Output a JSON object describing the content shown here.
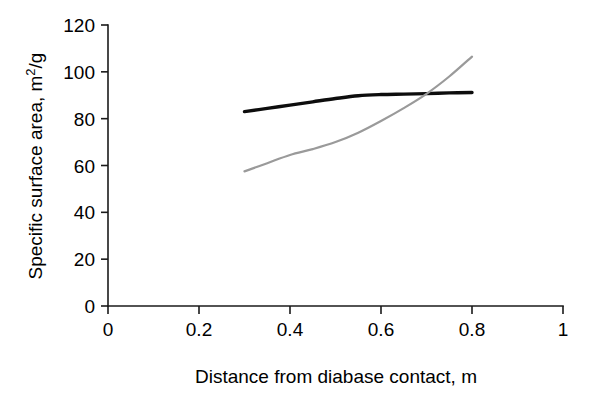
{
  "chart_data": {
    "type": "line",
    "title": "",
    "xlabel": "Distance from diabase contact, m",
    "ylabel": "Specific surface area, m2/g",
    "ylabel_parts": {
      "prefix": "Specific surface area, m",
      "superscript": "2",
      "suffix": "/g"
    },
    "xlim": [
      0,
      1
    ],
    "ylim": [
      0,
      120
    ],
    "xticks": [
      0,
      0.2,
      0.4,
      0.6,
      0.8,
      1
    ],
    "xticklabels": [
      "0",
      "0.2",
      "0.4",
      "0.6",
      "0.8",
      "1"
    ],
    "yticks": [
      0,
      20,
      40,
      60,
      80,
      100,
      120
    ],
    "yticklabels": [
      "0",
      "20",
      "40",
      "60",
      "80",
      "100",
      "120"
    ],
    "grid": false,
    "legend": "none",
    "series": [
      {
        "name": "black-curve",
        "color": "#0d0d0d",
        "linewidth": 3.4,
        "x": [
          0.3,
          0.35,
          0.4,
          0.45,
          0.5,
          0.55,
          0.6,
          0.65,
          0.7,
          0.75,
          0.8
        ],
        "values": [
          83.0,
          84.4,
          85.8,
          87.2,
          88.6,
          89.8,
          90.3,
          90.5,
          90.7,
          91.0,
          91.2
        ]
      },
      {
        "name": "gray-curve",
        "color": "#9a9a9a",
        "linewidth": 2.2,
        "x": [
          0.3,
          0.35,
          0.4,
          0.45,
          0.5,
          0.55,
          0.6,
          0.65,
          0.7,
          0.75,
          0.8
        ],
        "values": [
          57.5,
          61.0,
          64.5,
          67.0,
          70.0,
          74.0,
          79.0,
          84.5,
          90.6,
          98.0,
          106.5
        ]
      }
    ],
    "annotations": {
      "crossover_x": 0.7,
      "crossover_y": 90.6
    }
  },
  "axis_titles": {
    "x": "Distance from diabase contact, m"
  }
}
